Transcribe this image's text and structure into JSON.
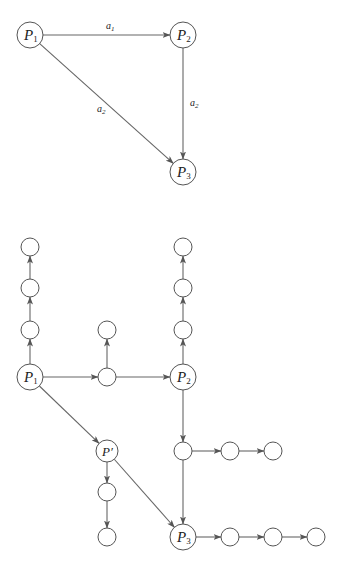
{
  "top_diagram": {
    "nodes": [
      {
        "id": "P1",
        "label": "P",
        "sub": "1",
        "x": 30,
        "y": 35,
        "r": 13
      },
      {
        "id": "P2",
        "label": "P",
        "sub": "2",
        "x": 183,
        "y": 35,
        "r": 13
      },
      {
        "id": "P3",
        "label": "P",
        "sub": "3",
        "x": 183,
        "y": 172,
        "r": 13
      }
    ],
    "edges": [
      {
        "from": "P1",
        "to": "P2",
        "label": "a",
        "sub": "1",
        "lx": 106,
        "ly": 29
      },
      {
        "from": "P2",
        "to": "P3",
        "label": "a",
        "sub": "2",
        "lx": 190,
        "ly": 106
      },
      {
        "from": "P1",
        "to": "P3",
        "label": "a",
        "sub": "2",
        "lx": 97,
        "ly": 112
      }
    ]
  },
  "bottom_diagram": {
    "nodes": [
      {
        "id": "L3",
        "label": "",
        "x": 30,
        "y": 247,
        "r": 9
      },
      {
        "id": "L2",
        "label": "",
        "x": 30,
        "y": 288,
        "r": 9
      },
      {
        "id": "L1",
        "label": "",
        "x": 30,
        "y": 330,
        "r": 9
      },
      {
        "id": "P1",
        "label": "P",
        "sub": "1",
        "x": 30,
        "y": 377,
        "r": 13
      },
      {
        "id": "M1",
        "label": "",
        "x": 107,
        "y": 330,
        "r": 9
      },
      {
        "id": "M0",
        "label": "",
        "x": 107,
        "y": 377,
        "r": 9
      },
      {
        "id": "R3",
        "label": "",
        "x": 183,
        "y": 247,
        "r": 9
      },
      {
        "id": "R2",
        "label": "",
        "x": 183,
        "y": 288,
        "r": 9
      },
      {
        "id": "R1",
        "label": "",
        "x": 183,
        "y": 330,
        "r": 9
      },
      {
        "id": "P2",
        "label": "P",
        "sub": "2",
        "x": 183,
        "y": 377,
        "r": 13
      },
      {
        "id": "Pp",
        "label": "P′",
        "sub": "",
        "x": 107,
        "y": 451,
        "r": 11
      },
      {
        "id": "Q1",
        "label": "",
        "x": 107,
        "y": 492,
        "r": 9
      },
      {
        "id": "Q2",
        "label": "",
        "x": 107,
        "y": 537,
        "r": 9
      },
      {
        "id": "C0",
        "label": "",
        "x": 183,
        "y": 451,
        "r": 9
      },
      {
        "id": "C1",
        "label": "",
        "x": 230,
        "y": 451,
        "r": 9
      },
      {
        "id": "C2",
        "label": "",
        "x": 273,
        "y": 451,
        "r": 9
      },
      {
        "id": "P3",
        "label": "P",
        "sub": "3",
        "x": 183,
        "y": 537,
        "r": 13
      },
      {
        "id": "D1",
        "label": "",
        "x": 230,
        "y": 537,
        "r": 9
      },
      {
        "id": "D2",
        "label": "",
        "x": 273,
        "y": 537,
        "r": 9
      },
      {
        "id": "D3",
        "label": "",
        "x": 316,
        "y": 537,
        "r": 9
      }
    ],
    "edges": [
      {
        "from": "P1",
        "to": "L1"
      },
      {
        "from": "L1",
        "to": "L2"
      },
      {
        "from": "L2",
        "to": "L3"
      },
      {
        "from": "P1",
        "to": "M0"
      },
      {
        "from": "M0",
        "to": "M1"
      },
      {
        "from": "M0",
        "to": "P2"
      },
      {
        "from": "P2",
        "to": "R1"
      },
      {
        "from": "R1",
        "to": "R2"
      },
      {
        "from": "R2",
        "to": "R3"
      },
      {
        "from": "P1",
        "to": "Pp"
      },
      {
        "from": "Pp",
        "to": "Q1"
      },
      {
        "from": "Q1",
        "to": "Q2"
      },
      {
        "from": "Pp",
        "to": "P3"
      },
      {
        "from": "P2",
        "to": "C0"
      },
      {
        "from": "C0",
        "to": "C1"
      },
      {
        "from": "C1",
        "to": "C2"
      },
      {
        "from": "C0",
        "to": "P3"
      },
      {
        "from": "P3",
        "to": "D1"
      },
      {
        "from": "D1",
        "to": "D2"
      },
      {
        "from": "D2",
        "to": "D3"
      }
    ]
  }
}
